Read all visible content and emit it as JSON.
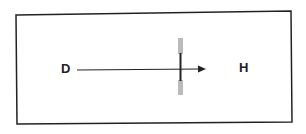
{
  "diagram": {
    "labels": {
      "left": "D",
      "right": "H"
    },
    "elements": {
      "frame": "rectangle border",
      "arrow": "horizontal arrow from D toward H",
      "barrier": "vertical bar crossing arrow, gray ends with black center"
    },
    "colors": {
      "line": "#222222",
      "bar_gray": "#bbbbbb",
      "background": "#ffffff"
    }
  }
}
